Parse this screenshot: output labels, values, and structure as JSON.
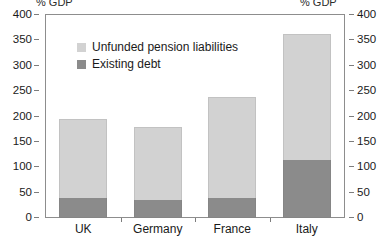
{
  "axes": {
    "left_unit_label": "% GDP",
    "right_unit_label": "% GDP",
    "tick_labels": [
      "400",
      "350",
      "300",
      "250",
      "200",
      "150",
      "100",
      "50",
      "0"
    ]
  },
  "legend": {
    "entries": [
      {
        "label": "Unfunded pension liabilities",
        "color": "#d2d2d2",
        "swatch": "light-gray-swatch"
      },
      {
        "label": "Existing debt",
        "color": "#8b8b8b",
        "swatch": "dark-gray-swatch"
      }
    ]
  },
  "chart_data": {
    "type": "bar",
    "stacked": true,
    "title": "",
    "subtitle": "",
    "xlabel": "",
    "ylabel": "% GDP",
    "ylim": [
      0,
      400
    ],
    "ytick_step": 50,
    "yticks": [
      0,
      50,
      100,
      150,
      200,
      250,
      300,
      350,
      400
    ],
    "grid": false,
    "legend_position": "inside-top-left",
    "categories": [
      "UK",
      "Germany",
      "France",
      "Italy"
    ],
    "series": [
      {
        "name": "Existing debt",
        "color": "#8b8b8b",
        "values": [
          40,
          35,
          40,
          115
        ]
      },
      {
        "name": "Unfunded pension liabilities",
        "color": "#d2d2d2",
        "values": [
          155,
          145,
          198,
          247
        ]
      }
    ],
    "totals": [
      195,
      180,
      238,
      362
    ]
  },
  "colors": {
    "light_gray": "#d2d2d2",
    "dark_gray": "#8b8b8b",
    "frame": "#8d8d8d",
    "background": "#ffffff",
    "text": "#1a1a1a"
  }
}
